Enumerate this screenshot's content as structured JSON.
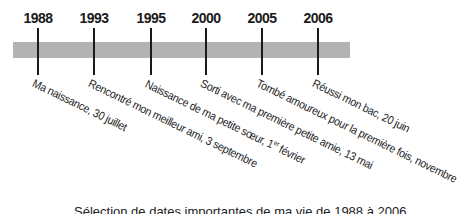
{
  "timeline": {
    "bar_color": "#b3b3b3",
    "events": [
      {
        "year": "1988",
        "label": "Ma naissance, 30 juillet",
        "x": 38
      },
      {
        "year": "1993",
        "label": "Rencontré mon meilleur ami, 3 septembre",
        "x": 94
      },
      {
        "year": "1995",
        "label": "Naissance de ma petite sœur, 1",
        "label_sup": "er",
        "label_tail": " février",
        "x": 151
      },
      {
        "year": "2000",
        "label": "Sorti avec ma première petite amie, 13 mai",
        "x": 206
      },
      {
        "year": "2005",
        "label": "Tombé amoureux pour la première fois, novembre",
        "x": 262
      },
      {
        "year": "2006",
        "label": "Réussi mon bac, 20 juin",
        "x": 318
      }
    ]
  },
  "caption": "Sélection de dates importantes de ma vie de 1988 à 2006"
}
